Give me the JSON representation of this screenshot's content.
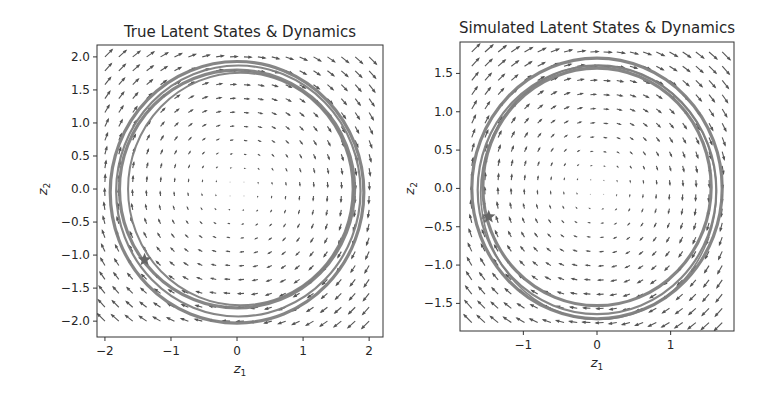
{
  "figure": {
    "background": "#ffffff",
    "trajectory_color": "#808080",
    "quiver_color": "#555555",
    "frame_color": "#333333"
  },
  "chart_data": [
    {
      "type": "quiver+line",
      "title": "True Latent States & Dynamics",
      "xlabel": "z1",
      "ylabel": "z2",
      "xlim": [
        -2.12,
        2.21
      ],
      "ylim": [
        -2.24,
        2.18
      ],
      "xticks": [
        -2,
        -1,
        0,
        1,
        2
      ],
      "xtick_labels": [
        "−2",
        "−1",
        "0",
        "1",
        "2"
      ],
      "yticks": [
        2.0,
        1.5,
        1.0,
        0.5,
        0.0,
        -0.5,
        -1.0,
        -1.5,
        -2.0
      ],
      "ytick_labels": [
        "2.0",
        "1.5",
        "1.0",
        "0.5",
        "0.0",
        "−0.5",
        "−1.0",
        "−1.5",
        "−2.0"
      ],
      "grid": false,
      "quiver": {
        "x_range": [
          -2.0,
          2.0
        ],
        "y_range": [
          -2.0,
          2.0
        ],
        "n": 20,
        "field": "clockwise rotation (dz1 = z2, dz2 = -z1)",
        "scale": 0.055
      },
      "trajectories": [
        {
          "cx": 0.0,
          "cy": -0.05,
          "rx": 1.92,
          "ry": 1.98,
          "width": 3.2
        },
        {
          "cx": 0.02,
          "cy": -0.03,
          "rx": 1.85,
          "ry": 1.9,
          "width": 2.2
        },
        {
          "cx": 0.0,
          "cy": 0.0,
          "rx": 1.78,
          "ry": 1.8,
          "width": 3.2
        },
        {
          "cx": 0.05,
          "cy": 0.0,
          "rx": 1.7,
          "ry": 1.76,
          "width": 2.0
        }
      ],
      "start_marker": {
        "x": -1.4,
        "y": -1.07,
        "shape": "star"
      },
      "box": {
        "left": 97,
        "top": 45,
        "right": 383,
        "bottom": 337
      }
    },
    {
      "type": "quiver+line",
      "title": "Simulated Latent States & Dynamics",
      "xlabel": "z1",
      "ylabel": "z2",
      "xlim": [
        -1.86,
        1.86
      ],
      "ylim": [
        -1.86,
        1.91
      ],
      "xticks": [
        -1,
        0,
        1
      ],
      "xtick_labels": [
        "−1",
        "0",
        "1"
      ],
      "yticks": [
        1.5,
        1.0,
        0.5,
        0.0,
        -0.5,
        -1.0,
        -1.5
      ],
      "ytick_labels": [
        "1.5",
        "1.0",
        "0.5",
        "0.0",
        "−0.5",
        "−1.0",
        "−1.5"
      ],
      "grid": false,
      "quiver": {
        "x_range": [
          -1.7,
          1.7
        ],
        "y_range": [
          -1.75,
          1.78
        ],
        "n": 20,
        "field": "clockwise rotation (dz1 = z2, dz2 = -z1)",
        "scale": 0.06
      },
      "trajectories": [
        {
          "cx": 0.0,
          "cy": 0.0,
          "rx": 1.7,
          "ry": 1.7,
          "width": 3.2
        },
        {
          "cx": 0.0,
          "cy": -0.02,
          "rx": 1.62,
          "ry": 1.62,
          "width": 2.2
        },
        {
          "cx": 0.0,
          "cy": 0.02,
          "rx": 1.55,
          "ry": 1.55,
          "width": 3.2
        },
        {
          "cx": 0.02,
          "cy": -0.05,
          "rx": 1.6,
          "ry": 1.66,
          "width": 1.6
        }
      ],
      "start_marker": {
        "x": -1.47,
        "y": -0.37,
        "shape": "star"
      },
      "box": {
        "left": 460,
        "top": 42,
        "right": 734,
        "bottom": 331
      }
    }
  ]
}
